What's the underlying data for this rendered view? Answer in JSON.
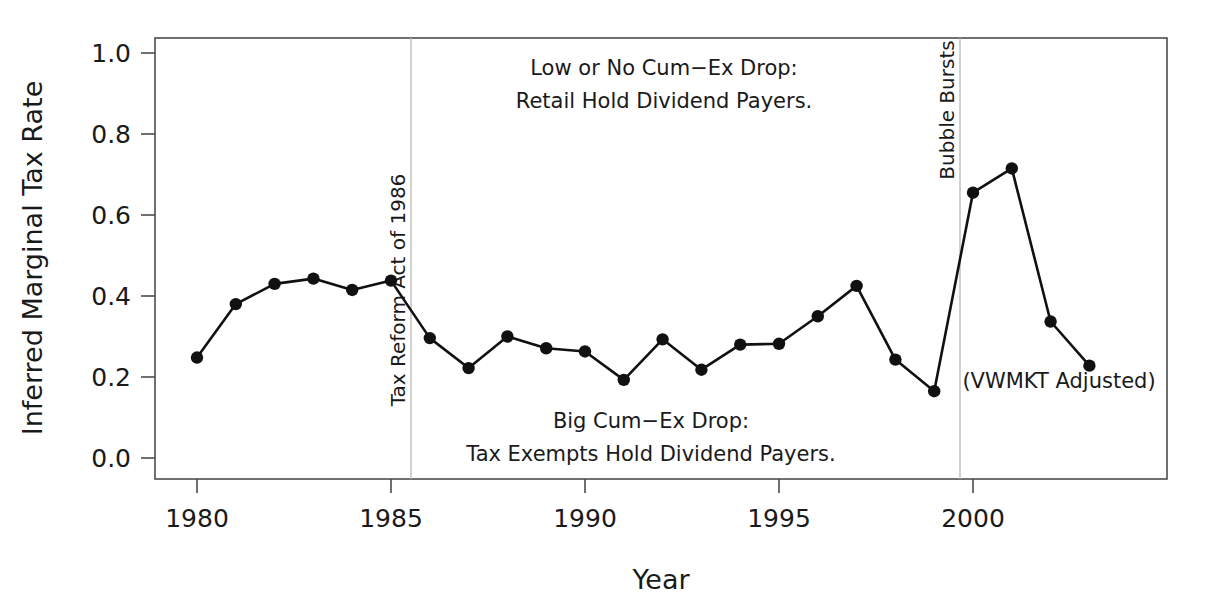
{
  "chart_data": {
    "type": "line",
    "title": "",
    "xlabel": "Year",
    "ylabel": "Inferred Marginal Tax Rate",
    "xlim": [
      1978.92,
      1985.0
    ],
    "ylim": [
      0.0,
      1.09
    ],
    "xticks": [
      1980,
      1985,
      1990,
      1995,
      2000
    ],
    "xticklabels": [
      "1980",
      "1985",
      "1990",
      "1995",
      "2000"
    ],
    "yticks": [
      0.0,
      0.2,
      0.4,
      0.6,
      0.8,
      1.0
    ],
    "yticklabels": [
      "0.0",
      "0.2",
      "0.4",
      "0.6",
      "0.8",
      "1.0"
    ],
    "grid": false,
    "legend": "none",
    "x": [
      1980,
      1981,
      1982,
      1983,
      1984,
      1985,
      1986,
      1987,
      1988,
      1989,
      1990,
      1991,
      1992,
      1993,
      1994,
      1995,
      1996,
      1997,
      1998,
      1999,
      2000,
      2001,
      2002,
      2003
    ],
    "values": [
      0.248,
      0.38,
      0.43,
      0.443,
      0.415,
      0.438,
      0.296,
      0.222,
      0.3,
      0.271,
      0.263,
      0.193,
      0.293,
      0.218,
      0.28,
      0.282,
      0.35,
      0.425,
      0.243,
      0.165,
      0.655,
      0.715,
      0.337,
      0.228
    ],
    "series": [
      {
        "name": "Inferred Marginal Tax Rate",
        "values": [
          0.248,
          0.38,
          0.43,
          0.443,
          0.415,
          0.438,
          0.296,
          0.222,
          0.3,
          0.271,
          0.263,
          0.193,
          0.293,
          0.218,
          0.28,
          0.282,
          0.35,
          0.425,
          0.243,
          0.165,
          0.655,
          0.715,
          0.337,
          0.228
        ],
        "color": "#111111",
        "marker": "circle"
      }
    ],
    "vlines": [
      {
        "name": "tax-reform-act-1986",
        "x": 1985.55,
        "label": "Tax Reform Act of 1986",
        "color": "#b8b8b8"
      },
      {
        "name": "bubble-bursts",
        "x": 1999.66,
        "label": "Bubble Bursts",
        "color": "#b8b8b8"
      }
    ],
    "annotations": [
      {
        "name": "upper-annotation",
        "lines": [
          "Low or No Cum−Ex Drop:",
          "Retail Hold Dividend Payers."
        ],
        "x": 1993.2,
        "y": 0.935
      },
      {
        "name": "lower-annotation",
        "lines": [
          "Big Cum−Ex Drop:",
          "Tax Exempts Hold Dividend Payers."
        ],
        "x": 1992.6,
        "y": 0.125
      },
      {
        "name": "vwmkt-note",
        "lines": [
          "(VWMKT Adjusted)"
        ],
        "x": 2002.1,
        "y": 0.207
      }
    ]
  },
  "axis": {
    "ylabel": "Inferred Marginal Tax Rate",
    "xlabel": "Year"
  },
  "labels": {
    "tax_reform": "Tax Reform Act of 1986",
    "bubble_bursts": "Bubble Bursts",
    "upper_line1": "Low or No Cum−Ex Drop:",
    "upper_line2": "Retail Hold Dividend Payers.",
    "lower_line1": "Big Cum−Ex Drop:",
    "lower_line2": "Tax Exempts Hold Dividend Payers.",
    "vwmkt": "(VWMKT Adjusted)"
  },
  "yticklabels": {
    "t0": "0.0",
    "t1": "0.2",
    "t2": "0.4",
    "t3": "0.6",
    "t4": "0.8",
    "t5": "1.0"
  },
  "xticklabels": {
    "t0": "1980",
    "t1": "1985",
    "t2": "1990",
    "t3": "1995",
    "t4": "2000"
  }
}
